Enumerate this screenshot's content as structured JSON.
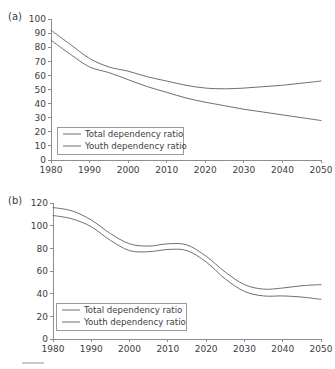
{
  "figure": {
    "panels": [
      {
        "key": "a",
        "label": "(a)",
        "legend": {
          "total_label": "Total dependency ratio",
          "youth_label": "Youth dependency ratio"
        }
      },
      {
        "key": "b",
        "label": "(b)",
        "legend": {
          "total_label": "Total dependency ratio",
          "youth_label": "Youth dependency ratio"
        }
      }
    ]
  },
  "chart_data": [
    {
      "type": "line",
      "panel": "(a)",
      "title": "",
      "xlabel": "",
      "ylabel": "",
      "xlim": [
        1980,
        2050
      ],
      "ylim": [
        0,
        100
      ],
      "xticks": [
        1980,
        1990,
        2000,
        2010,
        2020,
        2030,
        2040,
        2050
      ],
      "yticks": [
        0,
        10,
        20,
        30,
        40,
        50,
        60,
        70,
        80,
        90,
        100
      ],
      "grid": false,
      "legend_position": "lower-left",
      "x": [
        1980,
        1985,
        1990,
        1995,
        2000,
        2005,
        2010,
        2015,
        2020,
        2025,
        2030,
        2035,
        2040,
        2045,
        2050
      ],
      "series": [
        {
          "name": "Total dependency ratio",
          "color": "#6f6f6f",
          "values": [
            92,
            82,
            72,
            66,
            63,
            59,
            56,
            53,
            51,
            50.5,
            51,
            52,
            53,
            54.5,
            56
          ]
        },
        {
          "name": "Youth dependency ratio",
          "color": "#6f6f6f",
          "values": [
            85,
            75,
            66,
            62,
            57,
            52,
            48,
            44,
            41,
            38.5,
            36,
            34,
            32,
            30,
            28
          ]
        }
      ]
    },
    {
      "type": "line",
      "panel": "(b)",
      "title": "",
      "xlabel": "",
      "ylabel": "",
      "xlim": [
        1980,
        2050
      ],
      "ylim": [
        0,
        120
      ],
      "xticks": [
        1980,
        1990,
        2000,
        2010,
        2020,
        2030,
        2040,
        2050
      ],
      "yticks": [
        0,
        20,
        40,
        60,
        80,
        100,
        120
      ],
      "grid": false,
      "legend_position": "lower-left",
      "x": [
        1980,
        1985,
        1990,
        1995,
        2000,
        2005,
        2010,
        2015,
        2020,
        2025,
        2030,
        2035,
        2040,
        2045,
        2050
      ],
      "series": [
        {
          "name": "Total dependency ratio",
          "color": "#6f6f6f",
          "values": [
            116,
            113,
            105,
            93,
            84,
            82,
            84,
            83,
            73,
            59,
            48,
            44,
            45,
            47,
            48
          ]
        },
        {
          "name": "Youth dependency ratio",
          "color": "#6f6f6f",
          "values": [
            109,
            106,
            99,
            87,
            78,
            77,
            79,
            78,
            68,
            53,
            42,
            38,
            38,
            37,
            35
          ]
        }
      ]
    }
  ]
}
